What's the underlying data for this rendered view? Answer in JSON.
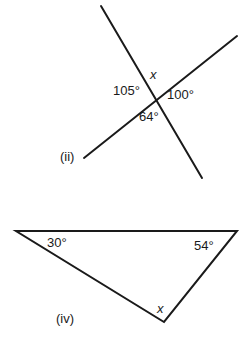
{
  "figures": [
    {
      "id": "ii",
      "label": "(ii)",
      "type": "intersecting-lines",
      "angles": {
        "top": "x",
        "left": "105°",
        "right": "100°",
        "bottom": "64°"
      }
    },
    {
      "id": "iv",
      "label": "(iv)",
      "type": "triangle",
      "angles": {
        "left": "30°",
        "right": "54°",
        "bottom": "x"
      }
    }
  ]
}
